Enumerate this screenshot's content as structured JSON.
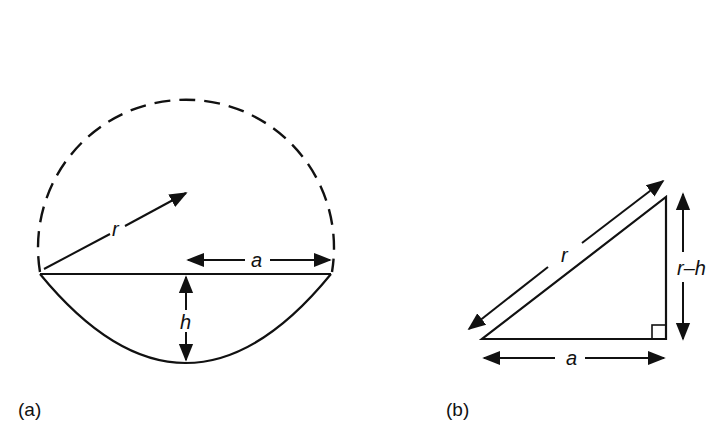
{
  "figure": {
    "panel_a": {
      "caption": "(a)",
      "labels": {
        "radius": "r",
        "half_chord": "a",
        "height": "h"
      }
    },
    "panel_b": {
      "caption": "(b)",
      "labels": {
        "hypotenuse": "r",
        "base": "a",
        "vertical": "r–h"
      }
    },
    "colors": {
      "stroke": "#111111",
      "background": "#ffffff"
    }
  }
}
